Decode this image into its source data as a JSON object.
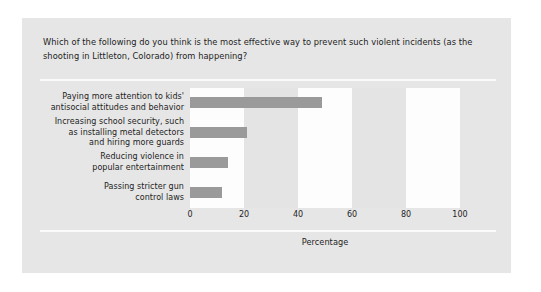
{
  "chart_data": {
    "type": "bar",
    "orientation": "horizontal",
    "title": "Which of the following do you think is the most effective way to prevent such violent incidents (as the shooting in Littleton, Colorado) from happening?",
    "categories": [
      "Paying more attention to kids' antisocial attitudes and behavior",
      "Increasing school security, such as installing metal detectors and hiring more guards",
      "Reducing violence in popular entertainment",
      "Passing stricter gun control laws"
    ],
    "category_lines": [
      [
        "Paying more attention to kids'",
        "antisocial attitudes and behavior"
      ],
      [
        "Increasing school security, such",
        "as installing metal detectors",
        "and hiring more guards"
      ],
      [
        "Reducing violence in",
        "popular entertainment"
      ],
      [
        "Passing stricter gun",
        "control laws"
      ]
    ],
    "values": [
      49,
      21,
      14,
      12
    ],
    "xlabel": "Percentage",
    "ylabel": "",
    "xlim": [
      0,
      100
    ],
    "xticks": [
      0,
      20,
      40,
      60,
      80,
      100
    ],
    "grid": false,
    "legend": "none",
    "bands": [
      {
        "from": 0,
        "to": 20,
        "shade": "light"
      },
      {
        "from": 20,
        "to": 40,
        "shade": "dark"
      },
      {
        "from": 40,
        "to": 60,
        "shade": "light"
      },
      {
        "from": 60,
        "to": 80,
        "shade": "dark"
      },
      {
        "from": 80,
        "to": 100,
        "shade": "light"
      }
    ]
  },
  "colors": {
    "page_background": "#ffffff",
    "panel_background": "#e6e6e6",
    "bar_fill": "#9a9a9a",
    "band_light": "#fdfdfd",
    "band_dark": "#e4e4e4",
    "rule": "#fbfbfb",
    "text": "#1d1d1d"
  }
}
